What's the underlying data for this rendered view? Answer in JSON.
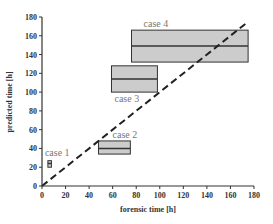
{
  "chart_data": {
    "type": "box",
    "title": "",
    "xlabel": "forensic time [h]",
    "ylabel": "predicted time [h]",
    "xlim": [
      0,
      180
    ],
    "ylim": [
      0,
      180
    ],
    "xticks": [
      0,
      20,
      40,
      60,
      80,
      100,
      120,
      140,
      160,
      180
    ],
    "yticks": [
      0,
      20,
      40,
      60,
      80,
      100,
      120,
      140,
      160,
      180
    ],
    "grid": false,
    "reference_line": {
      "type": "identity",
      "style": "dashed",
      "from": [
        0,
        0
      ],
      "to": [
        175,
        175
      ]
    },
    "series": [
      {
        "name": "case 1",
        "x_min": 5,
        "x_max": 8,
        "y_min": 20,
        "y_median": 24,
        "y_max": 27
      },
      {
        "name": "case 2",
        "x_min": 48,
        "x_max": 75,
        "y_min": 34,
        "y_median": 40,
        "y_max": 48
      },
      {
        "name": "case 3",
        "x_min": 59,
        "x_max": 98,
        "y_min": 100,
        "y_median": 114,
        "y_max": 128
      },
      {
        "name": "case 4",
        "x_min": 76,
        "x_max": 175,
        "y_min": 132,
        "y_median": 149,
        "y_max": 166
      }
    ],
    "colors": {
      "box_fill": "#cccccc",
      "box_stroke": "#333333",
      "axis": "#333333",
      "label": "#777777"
    }
  }
}
